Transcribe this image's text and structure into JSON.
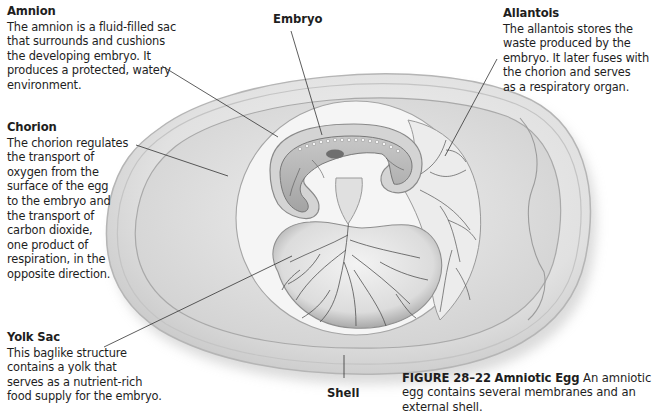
{
  "figure": {
    "type": "labeled-biology-diagram",
    "subject": "Amniotic Egg",
    "colors": {
      "background": "#ffffff",
      "egg_shell": "#d8d8d8",
      "egg_fill": "#e9e9e9",
      "albumen": "#dcdcdc",
      "amniotic_cavity": "#f4f4f4",
      "membrane_stroke": "#9a9a9a",
      "vessel": "#4a4a4a",
      "leader_line": "#333333",
      "text": "#1e1e1e"
    }
  },
  "labels": {
    "amnion": {
      "title": "Amnion",
      "description": "The amnion is a fluid-filled sac\nthat surrounds and cushions\nthe developing embryo. It\nproduces a protected, watery\nenvironment."
    },
    "chorion": {
      "title": "Chorion",
      "description": "The chorion regulates\nthe transport of\noxygen from the\nsurface of the egg\nto the embryo and\nthe transport of\ncarbon dioxide,\none product of\nrespiration, in the\nopposite direction."
    },
    "yolk_sac": {
      "title": "Yolk Sac",
      "description": "This baglike structure\ncontains a yolk that\nserves as a nutrient-rich\nfood supply for the embryo."
    },
    "allantois": {
      "title": "Allantois",
      "description": "The allantois stores the\nwaste produced by the\nembryo. It later fuses with\nthe chorion and serves\nas a respiratory organ."
    },
    "embryo": {
      "title": "Embryo"
    },
    "shell": {
      "title": "Shell"
    }
  },
  "caption": {
    "figure_number": "FIGURE 28–22",
    "figure_title": "Amniotic Egg",
    "text": "An amniotic egg contains several membranes and an external shell."
  }
}
